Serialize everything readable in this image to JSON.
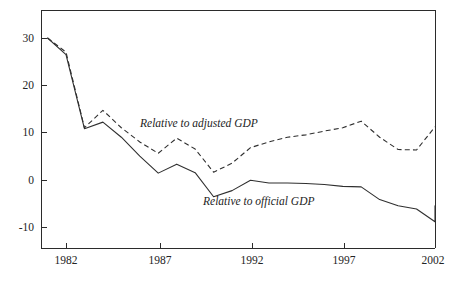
{
  "chart_data": {
    "type": "line",
    "title": "",
    "subtitle": "",
    "xlabel": "",
    "ylabel": "",
    "xlim": [
      1981,
      2002
    ],
    "ylim": [
      -14,
      35
    ],
    "grid": false,
    "legend_position": "inline-annotations",
    "x_ticks": [
      "1982",
      "1987",
      "1992",
      "1997",
      "2002"
    ],
    "x_tick_values": [
      1982,
      1987,
      1992,
      1997,
      2002
    ],
    "y_ticks": [
      "30",
      "20",
      "10",
      "0",
      "-10"
    ],
    "y_tick_values": [
      30,
      20,
      10,
      0,
      -10
    ],
    "x": [
      1981,
      1982,
      1983,
      1984,
      1985,
      1986,
      1987,
      1988,
      1989,
      1990,
      1991,
      1992,
      1993,
      1994,
      1995,
      1996,
      1997,
      1998,
      1999,
      2000,
      2001,
      2002
    ],
    "series": [
      {
        "name": "Relative to adjusted GDP",
        "style": "dashed",
        "annotation": "Relative to adjusted GDP",
        "values": [
          30.0,
          27.0,
          11.0,
          14.7,
          11.0,
          8.0,
          5.6,
          8.8,
          6.5,
          1.6,
          3.5,
          6.8,
          8.0,
          9.0,
          9.5,
          10.3,
          11.0,
          12.4,
          9.0,
          6.4,
          6.3,
          11.2
        ]
      },
      {
        "name": "Relative to official GDP",
        "style": "solid",
        "annotation": "Relative to official GDP",
        "values": [
          30.0,
          26.5,
          10.8,
          12.2,
          9.0,
          5.0,
          1.4,
          3.3,
          1.5,
          -3.6,
          -2.3,
          -0.1,
          -0.7,
          -0.7,
          -0.8,
          -1.0,
          -1.4,
          -1.5,
          -4.2,
          -5.5,
          -6.2,
          -8.9
        ]
      }
    ],
    "annotations": [
      {
        "text": "Relative to adjusted GDP",
        "x": 1987.0,
        "y": 13.0
      },
      {
        "text": "Relative to official GDP",
        "x": 1990.3,
        "y": -4.6
      }
    ],
    "extra_points": {
      "solid_tail": {
        "x": 2002,
        "y": -5.5,
        "note": "final rebound segment endpoint at right axis"
      }
    },
    "colors": {
      "line": "#2f2f2f",
      "axis": "#2b2b2b",
      "text": "#242424",
      "background": "#ffffff"
    }
  },
  "geometry": {
    "plot_left": 41,
    "plot_right": 435,
    "plot_top": 10,
    "plot_bottom": 248,
    "y_pixel_at_30": 38,
    "y_pixel_at_minus10": 227,
    "x_pixel_at_1982": 66,
    "x_pixel_at_2002": 435
  }
}
